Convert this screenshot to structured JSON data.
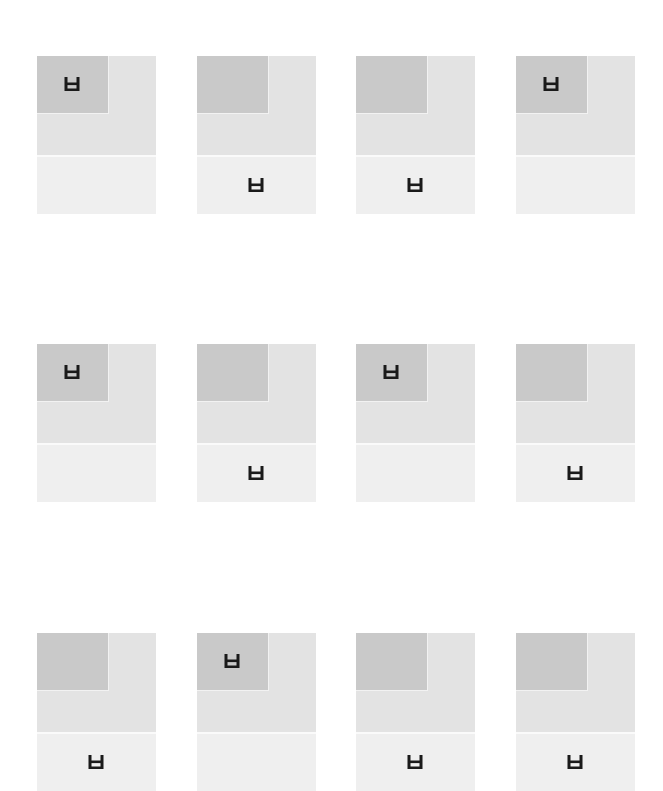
{
  "colors": {
    "background": "#ffffff",
    "upper_panel": "#e3e3e3",
    "dark_square": "#c9c9c9",
    "lower_panel": "#efefef",
    "glyph": "#1a1a1a"
  },
  "glyph": {
    "icon": "h-bracket-icon",
    "description": "rectangle with two vertical strokes rising from top corners"
  },
  "grid": {
    "rows": 3,
    "columns": 4,
    "tiles": [
      {
        "row": 1,
        "col": 1,
        "glyph_position": "top"
      },
      {
        "row": 1,
        "col": 2,
        "glyph_position": "bottom"
      },
      {
        "row": 1,
        "col": 3,
        "glyph_position": "bottom"
      },
      {
        "row": 1,
        "col": 4,
        "glyph_position": "top"
      },
      {
        "row": 2,
        "col": 1,
        "glyph_position": "top"
      },
      {
        "row": 2,
        "col": 2,
        "glyph_position": "bottom"
      },
      {
        "row": 2,
        "col": 3,
        "glyph_position": "top"
      },
      {
        "row": 2,
        "col": 4,
        "glyph_position": "bottom"
      },
      {
        "row": 3,
        "col": 1,
        "glyph_position": "bottom"
      },
      {
        "row": 3,
        "col": 2,
        "glyph_position": "top"
      },
      {
        "row": 3,
        "col": 3,
        "glyph_position": "bottom"
      },
      {
        "row": 3,
        "col": 4,
        "glyph_position": "bottom"
      }
    ]
  }
}
